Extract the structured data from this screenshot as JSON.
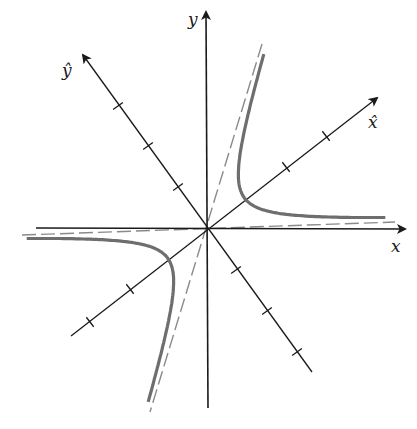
{
  "diagram": {
    "title": "",
    "colors": {
      "axis": "#1a1a1a",
      "curve": "#6e6e6e",
      "asymptote": "#8a8a8a",
      "background": "#ffffff"
    },
    "origin": [
      206,
      228
    ],
    "labels": {
      "x": "x",
      "y": "y",
      "x_hat": "x̂",
      "y_hat": "ŷ"
    },
    "label_positions": {
      "x": [
        391,
        252
      ],
      "y": [
        188,
        25
      ],
      "x_hat": [
        368,
        128
      ],
      "y_hat": [
        62,
        76
      ]
    },
    "axes": {
      "x_axis": {
        "from": [
          36,
          228
        ],
        "to": [
          405,
          229
        ]
      },
      "y_axis": {
        "from": [
          208,
          408
        ],
        "to": [
          206,
          12
        ]
      },
      "x_hat_axis": {
        "from": [
          71,
          336
        ],
        "to": [
          377,
          98
        ]
      },
      "y_hat_axis": {
        "from": [
          312,
          372
        ],
        "to": [
          83,
          55
        ]
      }
    },
    "ticks": {
      "x_hat": [
        [
          286,
          167
        ],
        [
          326,
          136
        ],
        [
          130,
          289
        ],
        [
          90,
          322
        ]
      ],
      "y_hat": [
        [
          178,
          187
        ],
        [
          148,
          146
        ],
        [
          118,
          106
        ],
        [
          236,
          270
        ],
        [
          267,
          311
        ],
        [
          297,
          352
        ]
      ]
    },
    "asymptotes": [
      {
        "from": [
          22,
          235
        ],
        "to": [
          395,
          222
        ]
      },
      {
        "from": [
          262,
          44
        ],
        "to": [
          150,
          412
        ]
      }
    ],
    "hyperbola": {
      "center": [
        206,
        228
      ],
      "u1": [
        189,
        -6
      ],
      "u2": [
        56,
        -184
      ],
      "scale": 30,
      "t_range": [
        -1.8,
        1.78
      ],
      "vertices": [
        [
          245,
          199
        ],
        [
          167,
          260
        ]
      ]
    }
  }
}
